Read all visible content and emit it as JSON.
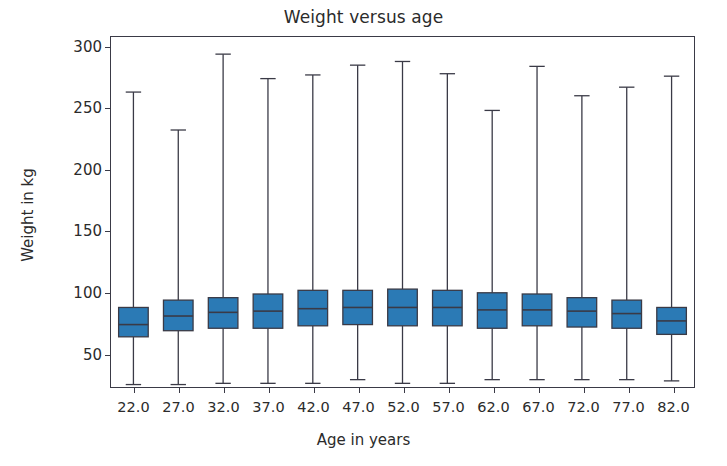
{
  "chart_data": {
    "type": "box",
    "title": "Weight versus age",
    "xlabel": "Age in years",
    "ylabel": "Weight in kg",
    "grid": false,
    "legend": null,
    "categories": [
      "22.0",
      "27.0",
      "32.0",
      "37.0",
      "42.0",
      "47.0",
      "52.0",
      "57.0",
      "62.0",
      "67.0",
      "72.0",
      "77.0",
      "82.0"
    ],
    "x_tick_labels": [
      "22.0",
      "27.0",
      "32.0",
      "37.0",
      "42.0",
      "47.0",
      "52.0",
      "57.0",
      "62.0",
      "67.0",
      "72.0",
      "77.0",
      "82.0"
    ],
    "y_tick_labels": [
      "50",
      "100",
      "150",
      "200",
      "250",
      "300"
    ],
    "y_ticks": [
      50,
      100,
      150,
      200,
      250,
      300
    ],
    "ylim": [
      22,
      308
    ],
    "xlim": [
      0,
      13
    ],
    "box_color": "#2b7ab5",
    "line_color": "#3a3a46",
    "boxes": [
      {
        "category": "22.0",
        "whisker_low": 24,
        "q1": 63,
        "median": 73,
        "q3": 87,
        "whisker_high": 263
      },
      {
        "category": "27.0",
        "whisker_low": 24,
        "q1": 68,
        "median": 80,
        "q3": 93,
        "whisker_high": 232
      },
      {
        "category": "32.0",
        "whisker_low": 25,
        "q1": 70,
        "median": 83,
        "q3": 95,
        "whisker_high": 294
      },
      {
        "category": "37.0",
        "whisker_low": 25,
        "q1": 70,
        "median": 84,
        "q3": 98,
        "whisker_high": 274
      },
      {
        "category": "42.0",
        "whisker_low": 25,
        "q1": 72,
        "median": 86,
        "q3": 101,
        "whisker_high": 277
      },
      {
        "category": "47.0",
        "whisker_low": 28,
        "q1": 73,
        "median": 87,
        "q3": 101,
        "whisker_high": 285
      },
      {
        "category": "52.0",
        "whisker_low": 25,
        "q1": 72,
        "median": 87,
        "q3": 102,
        "whisker_high": 288
      },
      {
        "category": "57.0",
        "whisker_low": 25,
        "q1": 72,
        "median": 87,
        "q3": 101,
        "whisker_high": 278
      },
      {
        "category": "62.0",
        "whisker_low": 28,
        "q1": 70,
        "median": 85,
        "q3": 99,
        "whisker_high": 248
      },
      {
        "category": "67.0",
        "whisker_low": 28,
        "q1": 72,
        "median": 85,
        "q3": 98,
        "whisker_high": 284
      },
      {
        "category": "72.0",
        "whisker_low": 28,
        "q1": 71,
        "median": 84,
        "q3": 95,
        "whisker_high": 260
      },
      {
        "category": "77.0",
        "whisker_low": 28,
        "q1": 70,
        "median": 82,
        "q3": 93,
        "whisker_high": 267
      },
      {
        "category": "82.0",
        "whisker_low": 27,
        "q1": 65,
        "median": 76,
        "q3": 87,
        "whisker_high": 276
      }
    ]
  }
}
